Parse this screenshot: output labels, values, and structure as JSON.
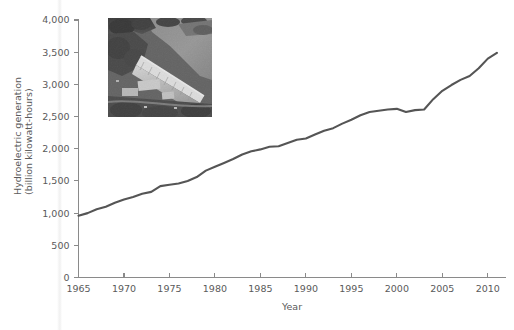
{
  "figure": {
    "background_color": "#ffffff",
    "text_color": "#5a5a5a",
    "axis_color": "#8a8a8a",
    "line_color": "#555555"
  },
  "inset": {
    "name": "hydroelectric-dam-aerial-photo",
    "alt": "Aerial black and white photograph of a hydroelectric dam with reservoir",
    "x": 108,
    "y": 18,
    "width": 104,
    "height": 99
  },
  "chart_data": {
    "type": "line",
    "title": "",
    "subtitle": "",
    "xlabel": "Year",
    "ylabel": "Hydroelectric generation\n(billion kilowatt-hours)",
    "ylabel_line1": "Hydroelectric generation",
    "ylabel_line2": "(billion kilowatt-hours)",
    "xlim": [
      1965,
      2012
    ],
    "ylim": [
      0,
      4000
    ],
    "xticks": [
      1965,
      1970,
      1975,
      1980,
      1985,
      1990,
      1995,
      2000,
      2005,
      2010
    ],
    "xticklabels": [
      "1965",
      "1970",
      "1975",
      "1980",
      "1985",
      "1990",
      "1995",
      "2000",
      "2005",
      "2010"
    ],
    "yticks": [
      0,
      500,
      1000,
      1500,
      2000,
      2500,
      3000,
      3500,
      4000
    ],
    "yticklabels": [
      "0",
      "500",
      "1,000",
      "1,500",
      "2,000",
      "2,500",
      "3,000",
      "3,500",
      "4,000"
    ],
    "grid": false,
    "legend": false,
    "legend_position": "none",
    "series": [
      {
        "name": "Hydroelectric generation",
        "color": "#555555",
        "x": [
          1965,
          1966,
          1967,
          1968,
          1969,
          1970,
          1971,
          1972,
          1973,
          1974,
          1975,
          1976,
          1977,
          1978,
          1979,
          1980,
          1981,
          1982,
          1983,
          1984,
          1985,
          1986,
          1987,
          1988,
          1989,
          1990,
          1991,
          1992,
          1993,
          1994,
          1995,
          1996,
          1997,
          1998,
          1999,
          2000,
          2001,
          2002,
          2003,
          2004,
          2005,
          2006,
          2007,
          2008,
          2009,
          2010,
          2011
        ],
        "values": [
          960,
          1000,
          1060,
          1100,
          1160,
          1210,
          1250,
          1300,
          1330,
          1420,
          1440,
          1460,
          1500,
          1560,
          1660,
          1720,
          1780,
          1840,
          1910,
          1960,
          1990,
          2030,
          2040,
          2090,
          2140,
          2160,
          2220,
          2280,
          2320,
          2390,
          2450,
          2520,
          2570,
          2590,
          2610,
          2620,
          2570,
          2600,
          2610,
          2770,
          2900,
          2990,
          3070,
          3130,
          3250,
          3400,
          3490
        ]
      }
    ],
    "annotations": []
  }
}
